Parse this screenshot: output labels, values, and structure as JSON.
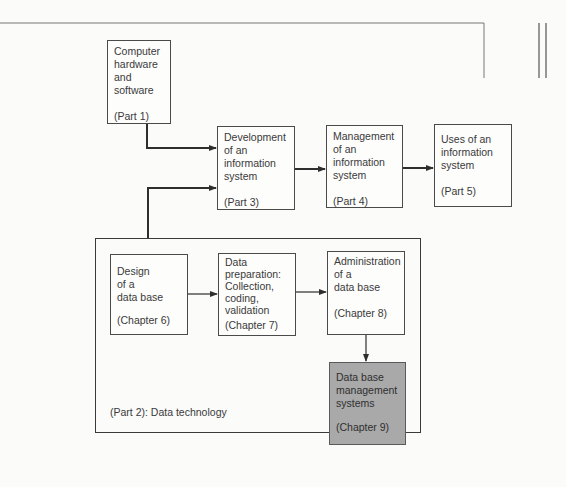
{
  "diagram": {
    "nodes": [
      {
        "id": "hw",
        "label": "Computer\nhardware\nand\nsoftware",
        "ref": "(Part 1)"
      },
      {
        "id": "dev",
        "label": "Development\nof an\ninformation\nsystem",
        "ref": "(Part 3)"
      },
      {
        "id": "mgmt",
        "label": "Management\nof an\ninformation\nsystem",
        "ref": "(Part 4)"
      },
      {
        "id": "uses",
        "label": "Uses of an\ninformation\nsystem",
        "ref": "(Part 5)"
      },
      {
        "id": "design",
        "label": "Design\nof a\ndata base",
        "ref": "(Chapter 6)"
      },
      {
        "id": "prep",
        "label": "Data\npreparation:\nCollection,\ncoding,\nvalidation",
        "ref": "(Chapter 7)"
      },
      {
        "id": "admin",
        "label": "Administration\nof a\ndata base",
        "ref": "(Chapter 8)"
      },
      {
        "id": "dbms",
        "label": "Data base\nmanagement\nsystems",
        "ref": "(Chapter 9)",
        "shaded": true
      }
    ],
    "group": {
      "id": "part2",
      "label": "(Part 2):  Data technology"
    },
    "edges": [
      [
        "hw",
        "dev"
      ],
      [
        "part2",
        "dev"
      ],
      [
        "dev",
        "mgmt"
      ],
      [
        "mgmt",
        "uses"
      ],
      [
        "design",
        "prep"
      ],
      [
        "prep",
        "admin"
      ],
      [
        "admin",
        "dbms"
      ]
    ],
    "colors": {
      "line": "#3a3a3a",
      "shaded_fill": "#a9a9a9",
      "background": "#fbfbfa"
    }
  }
}
